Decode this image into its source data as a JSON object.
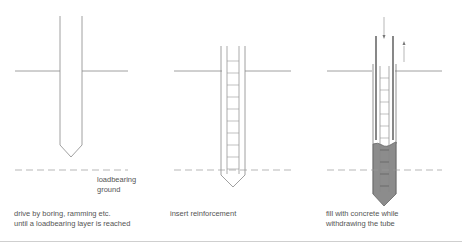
{
  "steps": [
    {
      "id": "step-1",
      "caption_line1": "drive by boring, ramming etc.",
      "caption_line2": "until a loadbearing layer is reached"
    },
    {
      "id": "step-2",
      "caption_line1": "insert reinforcement"
    },
    {
      "id": "step-3",
      "caption_line1": "fill with concrete while",
      "caption_line2": "withdrawing the tube"
    }
  ],
  "annotations": {
    "loadbearing_line1": "loadbearing",
    "loadbearing_line2": "ground"
  },
  "colors": {
    "line": "#888888",
    "concrete": "#8c8c8c",
    "text": "#555555"
  }
}
